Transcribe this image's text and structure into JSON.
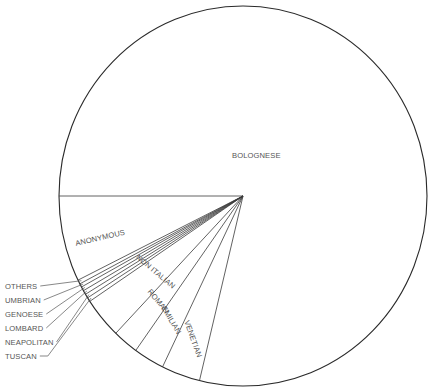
{
  "chart_data": {
    "type": "pie",
    "title": "",
    "start": "9 o'clock, slices proceed counter-clockwise from the horizontal-left radius downward",
    "slices": [
      {
        "label": "ANONYMOUS",
        "value": 7.3
      },
      {
        "label": "OTHERS",
        "value": 0.35
      },
      {
        "label": "UMBRIAN",
        "value": 0.3
      },
      {
        "label": "GENOESE",
        "value": 0.35
      },
      {
        "label": "LOMBARD",
        "value": 0.35
      },
      {
        "label": "NEAPOLITAN",
        "value": 0.35
      },
      {
        "label": "TUSCAN",
        "value": 0.35
      },
      {
        "label": "NON ITALIAN",
        "value": 3.5
      },
      {
        "label": "ROMAN",
        "value": 2.25
      },
      {
        "label": "EMILIAN",
        "value": 2.7
      },
      {
        "label": "VENETIAN",
        "value": 3.4
      },
      {
        "label": "BOLOGNESE",
        "value": 78.8
      }
    ],
    "value_unit": "percent (estimated from slice angles)",
    "outside_labels": [
      "OTHERS",
      "UMBRIAN",
      "GENOESE",
      "LOMBARD",
      "NEAPOLITAN",
      "TUSCAN"
    ],
    "legend": "none"
  }
}
